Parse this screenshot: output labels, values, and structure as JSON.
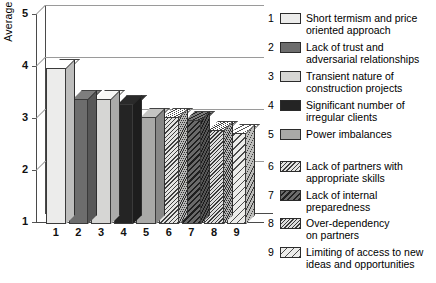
{
  "chart_data": {
    "type": "bar",
    "title": "",
    "xlabel": "",
    "ylabel": "Average value",
    "ylim": [
      1,
      5
    ],
    "yticks": [
      "1",
      "2",
      "3",
      "4",
      "5"
    ],
    "grid": true,
    "legend_position": "right",
    "categories": [
      "1",
      "2",
      "3",
      "4",
      "5",
      "6",
      "7",
      "8",
      "9"
    ],
    "values": [
      4.0,
      3.4,
      3.4,
      3.3,
      3.05,
      3.05,
      3.0,
      2.8,
      2.75
    ],
    "series": [
      {
        "name": "Average value",
        "values": [
          4.0,
          3.4,
          3.4,
          3.3,
          3.05,
          3.05,
          3.0,
          2.8,
          2.75
        ]
      }
    ],
    "legend": [
      {
        "key": "1",
        "label": "Short termism and price\noriented approach",
        "fill": "f-lightest",
        "color": "#ececeb"
      },
      {
        "key": "2",
        "label": "Lack of trust and\nadversarial relationships",
        "fill": "f-darkgray",
        "color": "#6d6d6d"
      },
      {
        "key": "3",
        "label": "Transient nature of\nconstruction projects",
        "fill": "f-light",
        "color": "#d6d6d4"
      },
      {
        "key": "4",
        "label": "Significant number of\nirregular clients",
        "fill": "f-black",
        "color": "#242424"
      },
      {
        "key": "5",
        "label": "Power imbalances",
        "fill": "f-mid",
        "color": "#a9a9a7"
      },
      {
        "key": "6",
        "label": "Lack of partners with\nappropriate skills",
        "fill": "f-hatch-fine",
        "color": "#e4e4e2"
      },
      {
        "key": "7",
        "label": "Lack of internal\npreparedness",
        "fill": "f-hatch-dark",
        "color": "#6a6a6a"
      },
      {
        "key": "8",
        "label": "Over-dependency\non partners",
        "fill": "f-hatch-dense",
        "color": "#dedede"
      },
      {
        "key": "9",
        "label": "Limiting of access to new\nideas and opportunities",
        "fill": "f-hatch-wide",
        "color": "#ececea"
      }
    ]
  }
}
